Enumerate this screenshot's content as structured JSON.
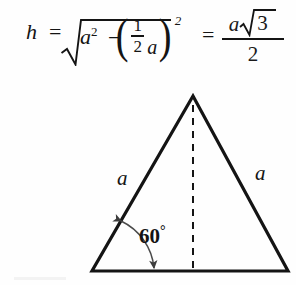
{
  "page": {
    "background_color": "#fefefe",
    "ink_color": "#141414",
    "width": 296,
    "height": 285
  },
  "formula": {
    "description": "Height of an equilateral triangle derived with the Pythagorean theorem",
    "lhs": "h",
    "equals_1": "=",
    "radicand": {
      "first_term_base": "a",
      "first_term_exponent": "2",
      "minus": "−",
      "paren_open": "(",
      "fraction_numerator": "1",
      "fraction_denominator": "2",
      "inner_variable": "a",
      "paren_close": ")",
      "paren_exponent": "2"
    },
    "equals_2": "=",
    "result": {
      "numerator_variable": "a",
      "numerator_radicand": "3",
      "denominator": "2"
    },
    "plain_text": "h = sqrt(a^2 - (1/2 a)^2) = a*sqrt(3)/2"
  },
  "diagram": {
    "type": "equilateral-triangle",
    "labels": {
      "left_side": "a",
      "right_side": "a",
      "base_angle": "60",
      "degree_symbol": "°"
    },
    "features": {
      "altitude_line_style": "dashed",
      "angle_arc_style": "double-headed-arrow",
      "apex": [
        193,
        96
      ],
      "base_left": [
        92,
        271
      ],
      "base_right": [
        288,
        271
      ]
    }
  }
}
